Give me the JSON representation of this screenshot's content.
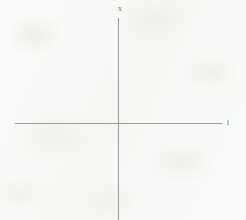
{
  "figure": {
    "kind": "coordinate-axes-diagram",
    "width": 246,
    "height": 220,
    "background_color": "#f7f7f5",
    "axis_color": "#9a9a9a",
    "label_color": "#6e6e6e"
  },
  "axes": {
    "vertical": {
      "label": "x",
      "position_x": 118,
      "start_y": 18,
      "end_y": 220
    },
    "horizontal": {
      "label": "t",
      "position_y": 123,
      "start_x": 15,
      "end_x": 222
    }
  },
  "chart_data": {
    "type": "line",
    "title": "",
    "subtitle": "",
    "xlabel": "t",
    "ylabel": "x",
    "xlim": [
      -103,
      104
    ],
    "ylim": [
      -97,
      105
    ],
    "x": [],
    "series": [],
    "categories": [],
    "values": [],
    "xticks": [],
    "yticks": [],
    "xticklabels": [],
    "yticklabels": [],
    "grid": false,
    "legend": false,
    "legend_position": "none",
    "annotations": [],
    "origin_pixel": [
      118,
      123
    ],
    "note": "Empty coordinate system: horizontal axis labeled t, vertical axis labeled x, no plotted data, no tick marks, no gridlines."
  }
}
